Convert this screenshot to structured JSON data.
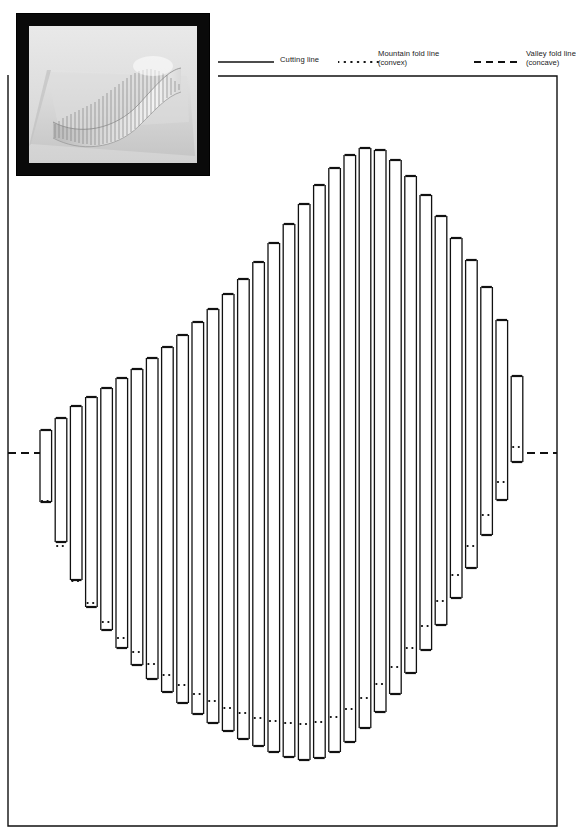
{
  "page": {
    "background_color": "#ffffff",
    "ink_color": "#000000",
    "frame": {
      "left": 8,
      "right": 557,
      "top": 75,
      "bottom": 826,
      "note": "L-shaped page border that steps around the photograph and legend at top-left"
    }
  },
  "photo": {
    "name": "pop-up-sculpture-photograph",
    "caption": "",
    "border_color": "#0a0a0a",
    "subject": "White paper pop-up wave sculpture built from parallel vertical strips on a light base sheet",
    "x": 17,
    "y": 14,
    "width": 192,
    "height": 161
  },
  "legend": {
    "entries": [
      {
        "key": "cutting",
        "label": "Cutting line",
        "sublabel": "",
        "sample": "solid-line",
        "sample_x": 0,
        "sample_w": 56,
        "label_x": 62
      },
      {
        "key": "mountain",
        "label": "Mountain fold line",
        "sublabel": "(convex)",
        "sample": "dotted-line",
        "sample_x": 120,
        "sample_w": 38,
        "label_x": 160
      },
      {
        "key": "valley",
        "label": "Valley fold line",
        "sublabel": "(concave)",
        "sample": "dashed-line",
        "sample_x": 258,
        "sample_w": 44,
        "label_x": 270
      }
    ]
  },
  "chart_data": {
    "type": "line",
    "xlabel": "",
    "ylabel": "",
    "grid": false,
    "legend_position": "top-right",
    "baseline_y": 453,
    "strip_pitch": 15.2,
    "strip_inner_width": 11.6,
    "first_strip_x": 40,
    "strip_count": 32,
    "series": [
      {
        "name": "strip top (valley fold)",
        "values": [
          430,
          418,
          406,
          397,
          388,
          378,
          369,
          358,
          347,
          335,
          322,
          309,
          294,
          279,
          262,
          243,
          224,
          204,
          185,
          168,
          155,
          148,
          150,
          160,
          176,
          195,
          216,
          238,
          260,
          287,
          320,
          376
        ]
      },
      {
        "name": "strip bottom (valley fold)",
        "values": [
          502,
          542,
          580,
          607,
          630,
          648,
          665,
          679,
          692,
          703,
          714,
          723,
          731,
          739,
          746,
          752,
          757,
          760,
          758,
          752,
          742,
          728,
          712,
          694,
          673,
          650,
          625,
          598,
          568,
          535,
          500,
          462
        ]
      },
      {
        "name": "mountain fold dot row (midpoint)",
        "values": [
          501,
          546,
          581,
          603,
          622,
          638,
          652,
          664,
          675,
          685,
          694,
          701,
          708,
          713,
          718,
          721,
          723,
          724,
          722,
          717,
          709,
          698,
          684,
          667,
          648,
          626,
          601,
          575,
          546,
          515,
          482,
          447
        ]
      }
    ],
    "side_fold_lines": [
      {
        "name": "left valley fold",
        "x1": 8,
        "x2": 40,
        "y": 453
      },
      {
        "name": "right valley fold",
        "x1": 527,
        "x2": 557,
        "y": 453
      }
    ]
  }
}
